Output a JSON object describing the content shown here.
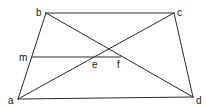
{
  "diagram": {
    "type": "geometry",
    "points": {
      "a": {
        "x": 18,
        "y": 99,
        "label": "a"
      },
      "b": {
        "x": 46,
        "y": 13,
        "label": "b"
      },
      "c": {
        "x": 174,
        "y": 13,
        "label": "c"
      },
      "d": {
        "x": 193,
        "y": 97,
        "label": "d"
      },
      "m": {
        "x": 32,
        "y": 57,
        "label": "m"
      },
      "e": {
        "x": 96,
        "y": 57,
        "label": "e"
      },
      "f": {
        "x": 121,
        "y": 57,
        "label": "f"
      }
    },
    "segments": [
      [
        "a",
        "b"
      ],
      [
        "b",
        "c"
      ],
      [
        "c",
        "d"
      ],
      [
        "a",
        "d"
      ],
      [
        "a",
        "c"
      ],
      [
        "b",
        "d"
      ],
      [
        "m",
        "f"
      ]
    ],
    "labels": {
      "a": "a",
      "b": "b",
      "c": "c",
      "d": "d",
      "m": "m",
      "e": "e",
      "f": "f"
    },
    "colors": {
      "stroke": "#2a2a2a",
      "text": "#1a1a1a",
      "background": "#ffffff"
    }
  }
}
